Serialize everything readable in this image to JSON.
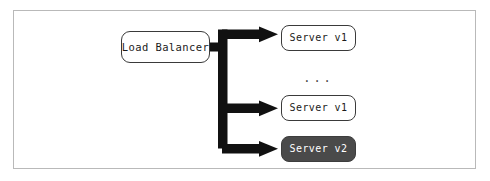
{
  "diagram": {
    "title": "",
    "colors": {
      "frame_border": "#b9b9b9",
      "node_border": "#3a3a3a",
      "node_fill": "#ffffff",
      "node_text": "#1b1b1b",
      "highlight_fill": "#4a4a4a",
      "highlight_text": "#ffffff",
      "arrow": "#111111",
      "background": "#ffffff"
    },
    "source": {
      "label": "Load Balancer"
    },
    "ellipsis": {
      "label": "..."
    },
    "targets": [
      {
        "label": "Server v1",
        "state": "normal"
      },
      {
        "label": "Server v1",
        "state": "normal"
      },
      {
        "label": "Server v2",
        "state": "highlighted"
      }
    ],
    "edges": [
      {
        "from": "Load Balancer",
        "to": "Server v1",
        "style": "thick-arrow"
      },
      {
        "from": "Load Balancer",
        "to": "Server v1",
        "style": "thick-arrow"
      },
      {
        "from": "Load Balancer",
        "to": "Server v2",
        "style": "thick-arrow"
      }
    ]
  }
}
